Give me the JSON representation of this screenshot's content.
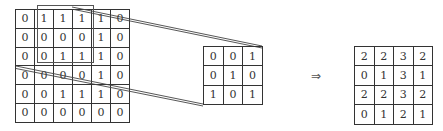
{
  "diagram": {
    "title": "",
    "input_matrix": [
      [
        "0",
        "1",
        "1",
        "1",
        "1",
        "0"
      ],
      [
        "0",
        "0",
        "0",
        "0",
        "1",
        "0"
      ],
      [
        "0",
        "0",
        "1",
        "1",
        "1",
        "0"
      ],
      [
        "0",
        "0",
        "0",
        "0",
        "1",
        "0"
      ],
      [
        "0",
        "0",
        "1",
        "1",
        "1",
        "0"
      ],
      [
        "0",
        "0",
        "0",
        "0",
        "0",
        "0"
      ]
    ],
    "kernel_matrix": [
      [
        "0",
        "0",
        "1"
      ],
      [
        "0",
        "1",
        "0"
      ],
      [
        "1",
        "0",
        "1"
      ]
    ],
    "output_matrix": [
      [
        "2",
        "2",
        "3",
        "2"
      ],
      [
        "0",
        "1",
        "3",
        "1"
      ],
      [
        "2",
        "2",
        "3",
        "2"
      ],
      [
        "0",
        "1",
        "2",
        "1"
      ]
    ],
    "arrow_symbol": "⇒",
    "highlight_window": {
      "rows": [
        0,
        2
      ],
      "cols": [
        1,
        3
      ]
    },
    "colors": {
      "grid_line": "#333333",
      "text": "#333333",
      "connector": "#444444",
      "background": "#ffffff"
    }
  }
}
